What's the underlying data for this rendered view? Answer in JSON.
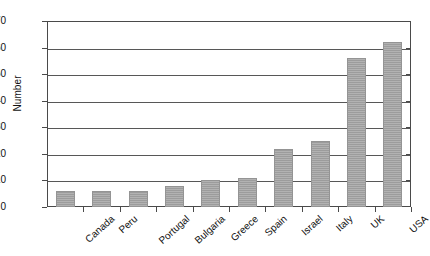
{
  "chart_data": {
    "type": "bar",
    "title": "",
    "subtitle": "",
    "xlabel": "",
    "ylabel": "Number",
    "categories": [
      "Canada",
      "Peru",
      "Portugal",
      "Bulgaria",
      "Greece",
      "Spain",
      "Israel",
      "Italy",
      "UK",
      "USA"
    ],
    "values": [
      6,
      6,
      6,
      8,
      10,
      11,
      22,
      25,
      56,
      62
    ],
    "ylim": [
      0,
      70
    ],
    "ytick_step": 10,
    "yticks": [
      0,
      10,
      20,
      30,
      40,
      50,
      60,
      70
    ],
    "ytick_labels": [
      "0",
      "10",
      "20",
      "30",
      "40",
      "50",
      "60",
      "70"
    ],
    "grid": true,
    "grid_axis": "y",
    "legend": false,
    "legend_position": "none",
    "orientation": "vertical",
    "bar_color": "#a3a3a3",
    "axis_color": "#4a4a4a",
    "background_color": "#ffffff",
    "xtick_label_rotation": -42
  }
}
